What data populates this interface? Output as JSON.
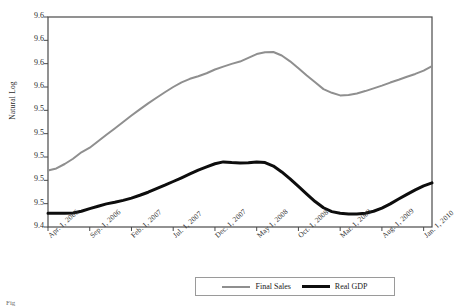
{
  "chart_data": {
    "type": "line",
    "title": "",
    "xlabel": "",
    "ylabel": "Natural Log",
    "ylim": [
      9.425,
      9.605
    ],
    "yticks": [
      9.6,
      9.6,
      9.6,
      9.6,
      9.5,
      9.5,
      9.5,
      9.5,
      9.5,
      9.4
    ],
    "ytick_labels": [
      "9.6",
      "9.6",
      "9.6",
      "9.6",
      "9.5",
      "9.5",
      "9.5",
      "9.5",
      "9.5",
      "9.4"
    ],
    "grid": false,
    "legend_position": "bottom",
    "x_tick_labels": [
      "Apr. 1, 2006",
      "Sep. 1, 2006",
      "Feb. 1, 2007",
      "Jul. 1, 2007",
      "Dec. 1, 2007",
      "May 1, 2008",
      "Oct. 1, 2008",
      "Mar. 1, 2009",
      "Aug. 1, 2009",
      "Jan. 1, 2010"
    ],
    "x": [
      "2006-04-01",
      "2006-05-01",
      "2006-06-01",
      "2006-07-01",
      "2006-08-01",
      "2006-09-01",
      "2006-10-01",
      "2006-11-01",
      "2006-12-01",
      "2007-01-01",
      "2007-02-01",
      "2007-03-01",
      "2007-04-01",
      "2007-05-01",
      "2007-06-01",
      "2007-07-01",
      "2007-08-01",
      "2007-09-01",
      "2007-10-01",
      "2007-11-01",
      "2007-12-01",
      "2008-01-01",
      "2008-02-01",
      "2008-03-01",
      "2008-04-01",
      "2008-05-01",
      "2008-06-01",
      "2008-07-01",
      "2008-08-01",
      "2008-09-01",
      "2008-10-01",
      "2008-11-01",
      "2008-12-01",
      "2009-01-01",
      "2009-02-01",
      "2009-03-01",
      "2009-04-01",
      "2009-05-01",
      "2009-06-01",
      "2009-07-01",
      "2009-08-01",
      "2009-09-01",
      "2009-10-01",
      "2009-11-01",
      "2009-12-01",
      "2010-01-01",
      "2010-02-01"
    ],
    "series": [
      {
        "name": "Final Sales",
        "color": "#8f8f8f",
        "width": 2,
        "values": [
          9.4735,
          9.4752,
          9.479,
          9.4835,
          9.489,
          9.493,
          9.4985,
          9.504,
          9.5095,
          9.515,
          9.5205,
          9.5258,
          9.531,
          9.5358,
          9.5405,
          9.545,
          9.549,
          9.552,
          9.5542,
          9.5568,
          9.56,
          9.5625,
          9.5648,
          9.5668,
          9.57,
          9.5732,
          9.5748,
          9.575,
          9.572,
          9.567,
          9.561,
          9.5548,
          9.549,
          9.5432,
          9.54,
          9.5378,
          9.5382,
          9.5395,
          9.5415,
          9.5438,
          9.5462,
          9.5488,
          9.5512,
          9.5538,
          9.5562,
          9.559,
          9.5628
        ]
      },
      {
        "name": "Real GDP",
        "color": "#0d0d0d",
        "width": 3,
        "values": [
          9.4368,
          9.4368,
          9.4368,
          9.437,
          9.4385,
          9.4408,
          9.4428,
          9.4448,
          9.4462,
          9.4478,
          9.4498,
          9.4522,
          9.4548,
          9.4578,
          9.4608,
          9.464,
          9.4672,
          9.4705,
          9.4738,
          9.4765,
          9.4792,
          9.4808,
          9.4802,
          9.4798,
          9.48,
          9.4808,
          9.4802,
          9.4772,
          9.4722,
          9.4662,
          9.4598,
          9.4532,
          9.4468,
          9.4415,
          9.4382,
          9.4368,
          9.4362,
          9.4362,
          9.4368,
          9.4385,
          9.4412,
          9.4448,
          9.449,
          9.453,
          9.4568,
          9.4602,
          9.4628
        ]
      }
    ]
  },
  "legend": {
    "items": [
      {
        "label": "Final Sales",
        "swatch": "line-swatch-gray"
      },
      {
        "label": "Real GDP",
        "swatch": "line-swatch-black"
      }
    ]
  },
  "caption": {
    "marker": "Fig"
  }
}
